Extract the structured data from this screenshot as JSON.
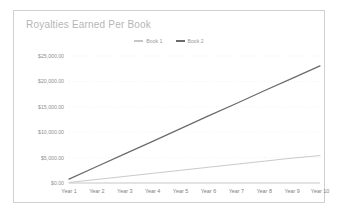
{
  "chart_data": {
    "type": "line",
    "title": "Royalties Earned Per Book",
    "xlabel": "",
    "ylabel": "",
    "categories": [
      "Year 1",
      "Year 2",
      "Year 3",
      "Year 4",
      "Year 5",
      "Year 6",
      "Year 7",
      "Year 8",
      "Year 9",
      "Year 10"
    ],
    "series": [
      {
        "name": "Book 1",
        "color": "#c6c6c6",
        "values": [
          100,
          700,
          1300,
          1900,
          2500,
          3100,
          3700,
          4300,
          4900,
          5400
        ]
      },
      {
        "name": "Book 2",
        "color": "#6b6b6b",
        "values": [
          750,
          3250,
          5720,
          8200,
          10700,
          13200,
          15650,
          18150,
          20600,
          23050
        ]
      }
    ],
    "ylim": [
      0,
      25000
    ],
    "yticks": [
      0,
      5000,
      10000,
      15000,
      20000,
      25000
    ],
    "ytick_labels": [
      "$0.00",
      "$5,000.00",
      "$10,000.00",
      "$15,000.00",
      "$20,000.00",
      "$25,000.00"
    ],
    "grid": true,
    "grid_color": "#ededed",
    "legend_position": "top-center",
    "axis_color": "#bcbcbc",
    "background": "#ffffff",
    "border_color": "#d0d0d0"
  },
  "legend": {
    "items": [
      {
        "label": "Book 1"
      },
      {
        "label": "Book 2"
      }
    ]
  }
}
